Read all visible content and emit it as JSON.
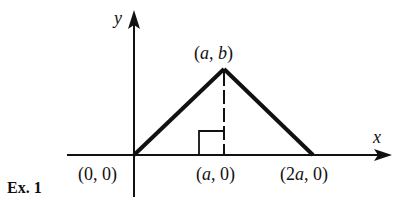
{
  "figure": {
    "caption": "Ex. 1",
    "axes": {
      "x_label": "x",
      "y_label": "y"
    },
    "points": {
      "origin": {
        "label_open": "(",
        "label_body": "0, 0",
        "label_close": ")"
      },
      "apex": {
        "label_open": "(",
        "a": "a",
        "sep": ", ",
        "b": "b",
        "label_close": ")"
      },
      "foot": {
        "label_open": "(",
        "a": "a",
        "rest": ", 0)"
      },
      "right_base": {
        "label_open": "(2",
        "a": "a",
        "rest": ", 0)"
      }
    },
    "colors": {
      "line": "#111111",
      "background": "#ffffff"
    }
  }
}
